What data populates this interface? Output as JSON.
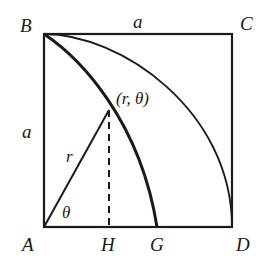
{
  "diagram": {
    "colors": {
      "stroke": "#1a1a1a",
      "background": "#ffffff"
    },
    "vertices": {
      "A": {
        "label": "A",
        "x": 44,
        "y": 227
      },
      "B": {
        "label": "B",
        "x": 44,
        "y": 34
      },
      "C": {
        "label": "C",
        "x": 232,
        "y": 34
      },
      "D": {
        "label": "D",
        "x": 232,
        "y": 227
      }
    },
    "points": {
      "G": {
        "label": "G",
        "x": 157,
        "y": 227
      },
      "H": {
        "label": "H",
        "x": 109,
        "y": 227
      },
      "P": {
        "label": "(r, θ)",
        "x": 109,
        "y": 110
      }
    },
    "labels": {
      "A": "A",
      "B": "B",
      "C": "C",
      "D": "D",
      "G": "G",
      "H": "H",
      "top_side": "a",
      "left_side": "a",
      "radius": "r",
      "angle": "θ",
      "point": "(r, θ)"
    },
    "curves": [
      {
        "name": "quarter-circle-arc",
        "from": "B",
        "to": "D",
        "center": "A",
        "style": "solid"
      },
      {
        "name": "quadratrix-curve",
        "from": "B",
        "to": "G",
        "style": "bold"
      }
    ],
    "segments": [
      {
        "name": "radius-line",
        "from": "A",
        "to": "P",
        "style": "solid"
      },
      {
        "name": "perpendicular-PH",
        "from": "P",
        "to": "H",
        "style": "dashed"
      }
    ]
  }
}
